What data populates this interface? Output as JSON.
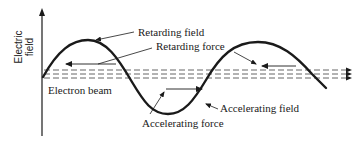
{
  "diagram": {
    "type": "physics-schematic",
    "y_axis": {
      "label_line1": "Electric",
      "label_line2": "field"
    },
    "labels": {
      "retarding_field": "Retarding field",
      "retarding_force": "Retarding force",
      "electron_beam": "Electron beam",
      "accelerating_field": "Accelerating field",
      "accelerating_force": "Accelerating force"
    },
    "colors": {
      "ink": "#1a1a1a",
      "beam": "#555555",
      "background": "#ffffff"
    },
    "elements": {
      "wave": "sine curve, ~1.5 periods, starting at axis on the beam line, rising to a crest, falling to a trough, rising to a second crest, then descending to the beam line at right",
      "beam": "three parallel dashed lines along the wave's midline, terminating in arrowheads at right",
      "force_arrows": [
        {
          "region": "first crest",
          "direction": "left",
          "meaning": "retarding force"
        },
        {
          "region": "second crest",
          "direction": "left",
          "meaning": "retarding force"
        },
        {
          "region": "trough",
          "direction": "right",
          "meaning": "accelerating force"
        }
      ]
    }
  }
}
